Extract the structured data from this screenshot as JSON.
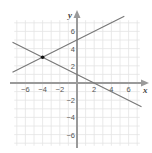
{
  "chart_data": {
    "type": "line",
    "title": "",
    "xlabel": "x",
    "ylabel": "y",
    "xlim": [
      -7.5,
      7.5
    ],
    "ylim": [
      -7.5,
      7.5
    ],
    "grid": true,
    "x_ticks": [
      -6,
      -4,
      -2,
      2,
      4,
      6
    ],
    "y_ticks": [
      6,
      4,
      2,
      -2,
      -4,
      -6
    ],
    "x_tick_labels": [
      "−6",
      "−4",
      "−2",
      "2",
      "4",
      "6"
    ],
    "y_tick_labels": [
      "6",
      "4",
      "2",
      "−2",
      "−4",
      "−6"
    ],
    "series": [
      {
        "name": "line-1",
        "equation": "y = x/2 + 5",
        "slope": 0.5,
        "intercept": 5,
        "x": [
          -7.5,
          5.5
        ],
        "y": [
          1.25,
          7.75
        ]
      },
      {
        "name": "line-2",
        "equation": "y = -x/2 + 1",
        "slope": -0.5,
        "intercept": 1,
        "x": [
          -7.5,
          7.5
        ],
        "y": [
          4.75,
          -2.75
        ]
      }
    ],
    "points": [
      {
        "label": "intersection",
        "x": -4,
        "y": 3
      }
    ]
  },
  "colors": {
    "grid": "#e4e4e4",
    "axis": "#9a9a9a",
    "line": "#777777",
    "point": "#111111"
  }
}
